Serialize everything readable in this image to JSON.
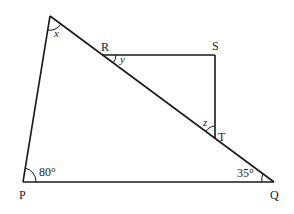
{
  "diagram": {
    "type": "geometry",
    "points": {
      "top": "",
      "P": "P",
      "Q": "Q",
      "R": "R",
      "S": "S",
      "T": "T"
    },
    "angles": {
      "x": "x",
      "y": "y",
      "z": "z",
      "P": "80°",
      "Q": "35°"
    },
    "colors": {
      "line": "#1a1a1a",
      "text": "#222222"
    }
  }
}
